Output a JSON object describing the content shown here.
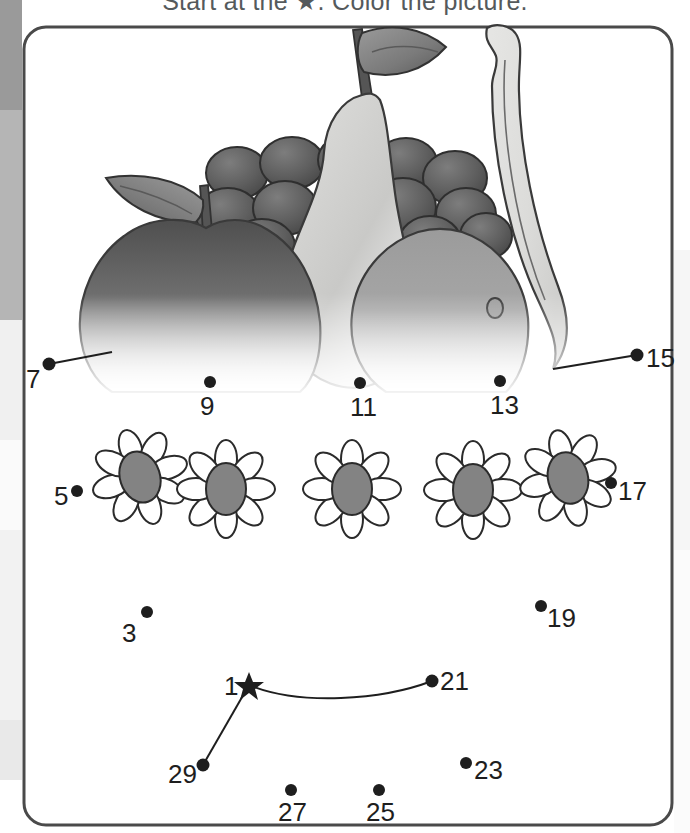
{
  "worksheet": {
    "instruction": "Start at the ★. Color the picture.",
    "border_color": "#4a4a4a",
    "background": "#ffffff"
  },
  "illustration": {
    "name": "fruit-still-life",
    "items": [
      "pear",
      "banana",
      "grapes",
      "apple",
      "orange",
      "leaf"
    ],
    "colors": {
      "outline": "#3a3a3a",
      "pear_light": "#d8d8d8",
      "pear_dark": "#a8a8a8",
      "banana_light": "#e4e4e4",
      "banana_dark": "#cfcfcf",
      "grape_light": "#6f6f6f",
      "grape_dark": "#4a4a4a",
      "apple_dark": "#585858",
      "orange_mid": "#9d9d9d",
      "leaf_light": "#8c8c8c",
      "leaf_dark": "#5c5c5c"
    }
  },
  "flowers": {
    "count": 5,
    "petal_fill": "#ffffff",
    "center_fill": "#838383",
    "outline": "#2b2b2b",
    "positions": [
      {
        "cx": 140,
        "cy": 477,
        "rot": -18
      },
      {
        "cx": 226,
        "cy": 489,
        "rot": 0
      },
      {
        "cx": 352,
        "cy": 489,
        "rot": 0
      },
      {
        "cx": 473,
        "cy": 490,
        "rot": 0
      },
      {
        "cx": 568,
        "cy": 478,
        "rot": -14
      }
    ]
  },
  "dots": [
    {
      "label": "1",
      "x": 249,
      "y": 685,
      "shape": "star",
      "lx": 224,
      "ly": 673,
      "align": "left"
    },
    {
      "label": "3",
      "x": 147,
      "y": 612,
      "shape": "dot",
      "lx": 122,
      "ly": 620,
      "align": "left"
    },
    {
      "label": "5",
      "x": 77,
      "y": 491,
      "shape": "dot",
      "lx": 54,
      "ly": 483,
      "align": "left"
    },
    {
      "label": "7",
      "x": 49,
      "y": 364,
      "shape": "dot",
      "lx": 26,
      "ly": 366,
      "align": "left"
    },
    {
      "label": "9",
      "x": 210,
      "y": 382,
      "shape": "dot",
      "lx": 200,
      "ly": 393,
      "align": "below"
    },
    {
      "label": "11",
      "x": 360,
      "y": 383,
      "shape": "dot",
      "lx": 350,
      "ly": 394,
      "align": "below"
    },
    {
      "label": "13",
      "x": 500,
      "y": 381,
      "shape": "dot",
      "lx": 490,
      "ly": 392,
      "align": "below"
    },
    {
      "label": "15",
      "x": 637,
      "y": 355,
      "shape": "dot",
      "lx": 646,
      "ly": 352,
      "align": "right"
    },
    {
      "label": "17",
      "x": 611,
      "y": 483,
      "shape": "dot",
      "lx": 618,
      "ly": 485,
      "align": "right"
    },
    {
      "label": "19",
      "x": 541,
      "y": 606,
      "shape": "dot",
      "lx": 547,
      "ly": 609,
      "align": "right"
    },
    {
      "label": "21",
      "x": 432,
      "y": 681,
      "shape": "dot",
      "lx": 440,
      "ly": 672,
      "align": "right"
    },
    {
      "label": "23",
      "x": 466,
      "y": 763,
      "shape": "dot",
      "lx": 474,
      "ly": 764,
      "align": "right"
    },
    {
      "label": "25",
      "x": 379,
      "y": 790,
      "shape": "dot",
      "lx": 368,
      "ly": 800,
      "align": "below"
    },
    {
      "label": "27",
      "x": 291,
      "y": 790,
      "shape": "dot",
      "lx": 280,
      "ly": 800,
      "align": "below"
    },
    {
      "label": "29",
      "x": 203,
      "y": 765,
      "shape": "dot",
      "lx": 168,
      "ly": 767,
      "align": "left"
    }
  ],
  "guide_lines": [
    {
      "name": "line-7-to-apple",
      "from": [
        49,
        364
      ],
      "to": [
        110,
        352
      ]
    },
    {
      "name": "line-15-to-banana",
      "from": [
        637,
        355
      ],
      "to": [
        553,
        369
      ]
    },
    {
      "name": "line-1-to-21-curve"
    },
    {
      "name": "line-1-to-29"
    }
  ]
}
